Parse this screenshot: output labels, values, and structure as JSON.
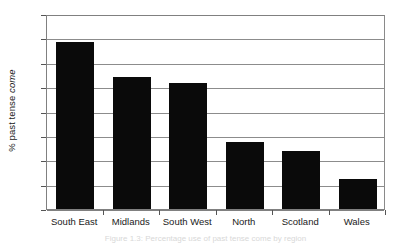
{
  "figure": {
    "caption": "Figure 1.3: Percentage use of past tense come by region"
  },
  "chart_data": {
    "type": "bar",
    "title": "",
    "subtitle": "",
    "xlabel": "",
    "ylabel": "% past tense come",
    "ylabel_plain": "% past tense ",
    "ylabel_italic": "come",
    "categories": [
      "South East",
      "Midlands",
      "South West",
      "North",
      "Scotland",
      "Wales"
    ],
    "values": [
      68.5,
      54,
      51.5,
      27.5,
      24,
      12.5
    ],
    "series": [
      {
        "name": "% past tense come",
        "values": [
          68.5,
          54,
          51.5,
          27.5,
          24,
          12.5
        ]
      }
    ],
    "ylim": [
      0,
      80
    ],
    "ytick_step": 10,
    "ytick_labels": [
      "80",
      "70",
      "60",
      "50",
      "40",
      "30",
      "20",
      "10",
      "0"
    ],
    "ytick_values": [
      80,
      70,
      60,
      50,
      40,
      30,
      20,
      10,
      0
    ],
    "grid": true,
    "grid_axis": "y",
    "legend": false,
    "legend_position": "none",
    "bar_color": "#0a0a0a",
    "grid_color": "#8c8c8c",
    "axis_color": "#808080",
    "background_color": "#ffffff"
  }
}
